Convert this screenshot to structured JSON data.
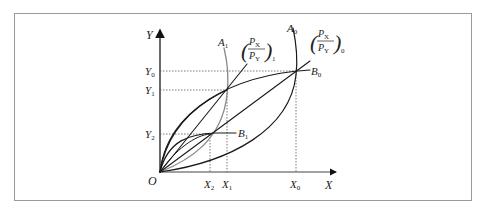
{
  "axes": {
    "y_label": "Y",
    "x_label": "X",
    "origin_label": "O"
  },
  "y_ticks": [
    {
      "main": "Y",
      "sub": "0"
    },
    {
      "main": "Y",
      "sub": "1"
    },
    {
      "main": "Y",
      "sub": "2"
    }
  ],
  "x_ticks": [
    {
      "main": "X",
      "sub": "2"
    },
    {
      "main": "X",
      "sub": "1"
    },
    {
      "main": "X",
      "sub": "0"
    }
  ],
  "curves": {
    "A1": {
      "main": "A",
      "sub": "1"
    },
    "A0": {
      "main": "A",
      "sub": "0"
    },
    "B0": {
      "main": "B",
      "sub": "0"
    },
    "B1": {
      "main": "B",
      "sub": "1"
    }
  },
  "price_ratios": {
    "ratio1": {
      "num_main": "P",
      "num_sub": "X",
      "den_main": "P",
      "den_sub": "Y",
      "outer_sub": "1"
    },
    "ratio0": {
      "num_main": "P",
      "num_sub": "X",
      "den_main": "P",
      "den_sub": "Y",
      "outer_sub": "0"
    }
  },
  "colors": {
    "border": "#9a9a9a",
    "line": "#1a1a1a",
    "gray_curve": "#888888",
    "dotted": "#555555"
  }
}
